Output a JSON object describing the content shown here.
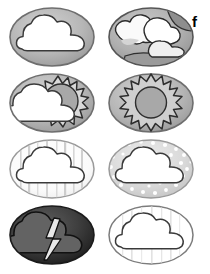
{
  "figure": {
    "panel_label": "f",
    "label_position": {
      "x": 192,
      "y": 14
    },
    "width": 210,
    "height": 274,
    "background_color": "#ffffff",
    "columns": 2,
    "rows": 4,
    "cells": [
      {
        "id": "cloudy",
        "name": "cloudy-icon",
        "row": 1,
        "column": 1,
        "x": 6,
        "y": 4,
        "description": "White cloud on medium gray oval",
        "oval_fill": "#b4b4b4",
        "oval_stroke": "#6e6e6e",
        "cloud_fill": "#ffffff",
        "cloud_stroke": "#3a3a3a",
        "features": [
          "cloud",
          "oval"
        ]
      },
      {
        "id": "broken-clouds",
        "name": "broken-clouds-icon",
        "row": 1,
        "column": 2,
        "x": 105,
        "y": 4,
        "description": "Multiple overlapping clouds with darker gray sky patches on oval",
        "oval_fill": "#b0b0b0",
        "oval_stroke": "#555555",
        "cloud_fill": "#fafafa",
        "cloud_shadow_fill": "#d8d8d8",
        "sky_patch_fill": "#909090",
        "cloud_stroke": "#333333",
        "features": [
          "cloud",
          "cloud",
          "cloud",
          "sky-patch",
          "oval"
        ]
      },
      {
        "id": "partly-sunny",
        "name": "partly-sunny-icon",
        "row": 2,
        "column": 1,
        "x": 6,
        "y": 70,
        "description": "Sun with zigzag rays partially behind a white cloud on gray oval",
        "oval_fill": "#b4b4b4",
        "oval_stroke": "#6e6e6e",
        "sun_fill": "#a8a8a8",
        "ray_fill": "#d9d9d9",
        "sun_stroke": "#2e2e2e",
        "cloud_fill": "#ffffff",
        "cloud_stroke": "#3a3a3a",
        "features": [
          "sun",
          "rays",
          "cloud",
          "oval"
        ]
      },
      {
        "id": "sunny",
        "name": "sunny-icon",
        "row": 2,
        "column": 2,
        "x": 105,
        "y": 70,
        "description": "Sun disc with zigzag rays on gray oval",
        "oval_fill": "#b4b4b4",
        "oval_stroke": "#6e6e6e",
        "sun_fill": "#a8a8a8",
        "ray_fill": "#cfcfcf",
        "sun_stroke": "#2e2e2e",
        "features": [
          "sun",
          "rays",
          "oval"
        ]
      },
      {
        "id": "rain",
        "name": "rain-icon",
        "row": 3,
        "column": 1,
        "x": 6,
        "y": 136,
        "description": "White cloud on very light oval with faint vertical rain streaks",
        "oval_fill": "#fbfbfb",
        "oval_stroke": "#9a9a9a",
        "cloud_fill": "#ffffff",
        "cloud_stroke": "#3a3a3a",
        "streak_color": "#d2d2d2",
        "features": [
          "cloud",
          "rain-streaks",
          "oval"
        ]
      },
      {
        "id": "snow",
        "name": "snow-icon",
        "row": 3,
        "column": 2,
        "x": 105,
        "y": 136,
        "description": "White cloud on light gray oval with white snow dots",
        "oval_fill": "#d9d9d9",
        "oval_stroke": "#9a9a9a",
        "cloud_fill": "#ffffff",
        "cloud_stroke": "#3a3a3a",
        "dot_color": "#ffffff",
        "features": [
          "cloud",
          "snow-dots",
          "oval"
        ]
      },
      {
        "id": "thunderstorm",
        "name": "thunderstorm-icon",
        "row": 4,
        "column": 1,
        "x": 6,
        "y": 202,
        "description": "Dark gray storm cloud with light lightning bolt on dark oval",
        "oval_fill": "#3c3c3c",
        "oval_stroke": "#1a1a1a",
        "cloud_fill": "#636363",
        "cloud_stroke": "#111111",
        "bolt_fill": "#e8e8e8",
        "bolt_stroke": "#111111",
        "features": [
          "cloud",
          "lightning-bolt",
          "oval"
        ]
      },
      {
        "id": "light-showers",
        "name": "light-showers-icon",
        "row": 4,
        "column": 2,
        "x": 105,
        "y": 202,
        "description": "White cloud on white oval with very faint vertical drizzle lines",
        "oval_fill": "#ffffff",
        "oval_stroke": "#7c7c7c",
        "cloud_fill": "#ffffff",
        "cloud_stroke": "#3a3a3a",
        "streak_color": "#e2e2e2",
        "features": [
          "cloud",
          "drizzle-lines",
          "oval"
        ]
      }
    ]
  }
}
